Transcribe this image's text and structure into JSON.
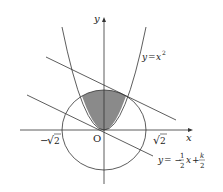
{
  "diagram": {
    "type": "math-graph",
    "axes": {
      "x_label": "x",
      "y_label": "y",
      "origin_label": "O"
    },
    "ticks": {
      "neg_sqrt2": "−√2",
      "pos_sqrt2": "√2",
      "neg_prefix": "−",
      "radicand": "2"
    },
    "curves": {
      "parabola_label": "y = x²",
      "parabola_lhs": "y",
      "parabola_eq": "=",
      "parabola_rhs": "x",
      "parabola_exp": "2",
      "line_label": "y = −(1/2)x + k/2",
      "line_lhs": "y",
      "line_eq": "= −",
      "line_frac1_num": "1",
      "line_frac1_den": "2",
      "line_x": "x",
      "line_plus": "+",
      "line_frac2_num": "k",
      "line_frac2_den": "2",
      "circle": "x² + y² = 2"
    },
    "shaded_region": "region inside circle above parabola",
    "colors": {
      "stroke": "#333333",
      "shade": "#8a8a8a",
      "background": "#ffffff"
    }
  }
}
